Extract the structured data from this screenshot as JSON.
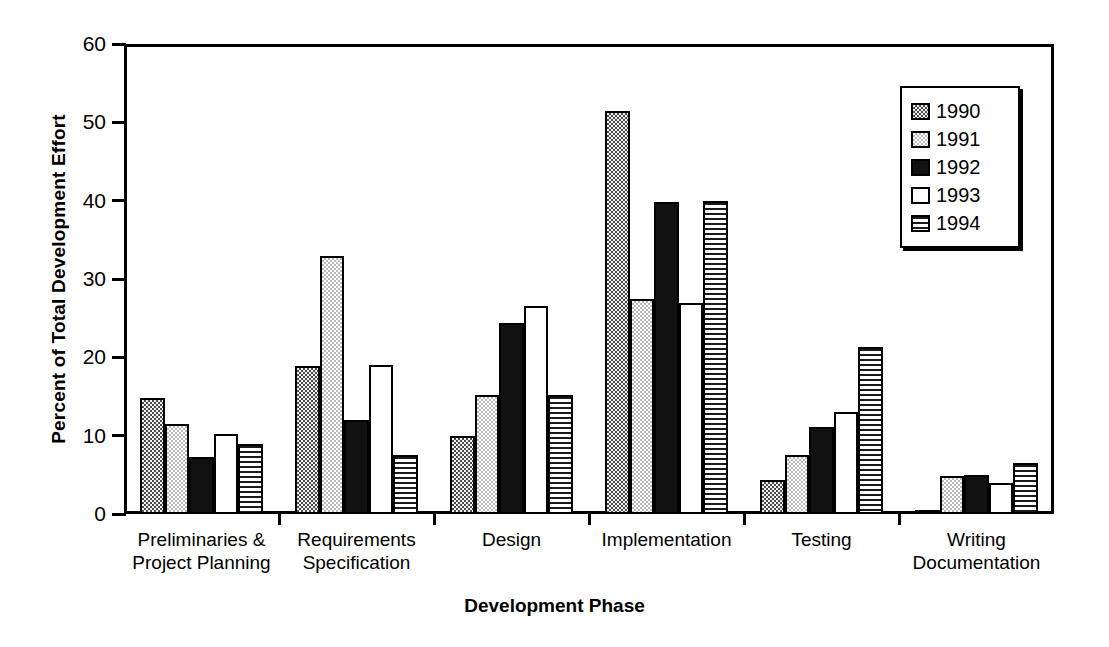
{
  "chart_data": {
    "type": "bar",
    "title": "",
    "xlabel": "Development Phase",
    "ylabel": "Percent of Total Development Effort",
    "ylim": [
      0,
      60
    ],
    "yticks": [
      0,
      10,
      20,
      30,
      40,
      50,
      60
    ],
    "grid": false,
    "legend_position": "top-right",
    "categories": [
      "Preliminaries &\nProject Planning",
      "Requirements\nSpecification",
      "Design",
      "Implementation",
      "Testing",
      "Writing\nDocumentation"
    ],
    "category_lines": [
      [
        "Preliminaries &",
        "Project Planning"
      ],
      [
        "Requirements",
        "Specification"
      ],
      [
        "Design",
        ""
      ],
      [
        "Implementation",
        ""
      ],
      [
        "Testing",
        ""
      ],
      [
        "Writing",
        "Documentation"
      ]
    ],
    "series": [
      {
        "name": "1990",
        "fill": "gray-checker",
        "values": [
          14.8,
          18.9,
          10.0,
          51.4,
          4.4,
          0.3
        ]
      },
      {
        "name": "1991",
        "fill": "light-checker",
        "values": [
          11.5,
          33.0,
          15.2,
          27.5,
          7.5,
          4.8
        ]
      },
      {
        "name": "1992",
        "fill": "solid-black",
        "values": [
          7.3,
          12.0,
          24.4,
          39.8,
          11.1,
          5.0
        ]
      },
      {
        "name": "1993",
        "fill": "white",
        "values": [
          10.2,
          19.0,
          26.5,
          27.0,
          13.0,
          4.0
        ]
      },
      {
        "name": "1994",
        "fill": "horizontal-stripe",
        "values": [
          9.0,
          7.5,
          15.2,
          40.0,
          21.3,
          6.5
        ]
      }
    ]
  },
  "axes": {
    "y_title": "Percent of Total Development Effort",
    "x_title": "Development Phase",
    "y_tick_labels": [
      "0",
      "10",
      "20",
      "30",
      "40",
      "50",
      "60"
    ]
  },
  "legend": {
    "entries": [
      {
        "label": "1990"
      },
      {
        "label": "1991"
      },
      {
        "label": "1992"
      },
      {
        "label": "1993"
      },
      {
        "label": "1994"
      }
    ]
  },
  "colors": {
    "axis": "#000000",
    "background": "#ffffff",
    "series_1992": "#111111",
    "series_1990_dither": "#4a4a4a",
    "series_1991_dither": "#b9b9b9",
    "series_1994_stripe": "#1a1a1a"
  }
}
